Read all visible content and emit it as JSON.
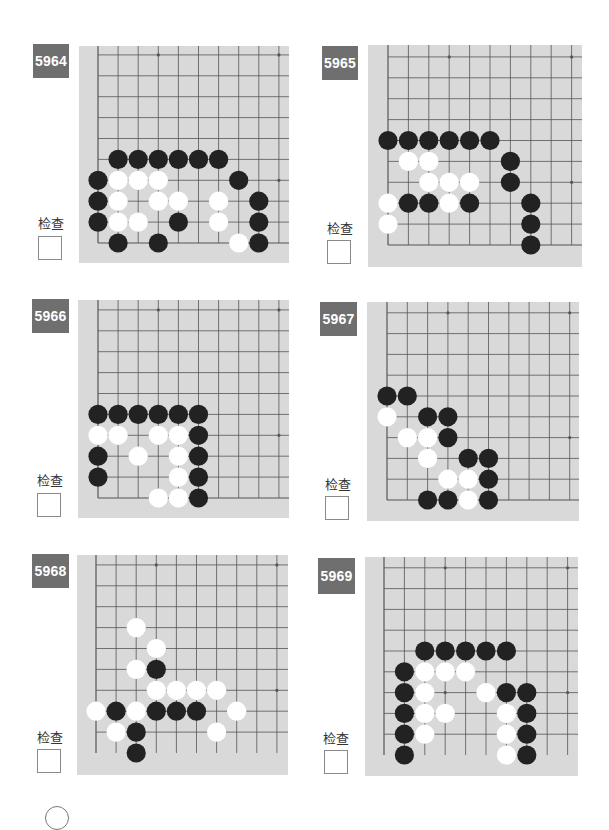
{
  "page": {
    "check_label": "检查",
    "colors": {
      "badge": "#6f6f6f",
      "board": "#d9d9d9",
      "grid": "#555555",
      "black_stone": "#222222",
      "white_stone": "#ffffff"
    }
  },
  "problems": [
    {
      "number": "5964",
      "badge": {
        "x": 33,
        "y": 44,
        "w": 36,
        "h": 34
      },
      "check": {
        "label_x": 33,
        "label_y": 213,
        "box_x": 38,
        "box_y": 236
      },
      "board": {
        "x": 79,
        "y": 46,
        "w": 210,
        "h": 217,
        "x0": 98,
        "y0": 243,
        "dx": 20.1,
        "dy": 20.9,
        "bottom_edge": true
      },
      "stones": [
        {
          "c": 1,
          "r": 4,
          "color": "B"
        },
        {
          "c": 2,
          "r": 4,
          "color": "B"
        },
        {
          "c": 3,
          "r": 4,
          "color": "B"
        },
        {
          "c": 4,
          "r": 4,
          "color": "B"
        },
        {
          "c": 5,
          "r": 4,
          "color": "B"
        },
        {
          "c": 6,
          "r": 4,
          "color": "B"
        },
        {
          "c": 0,
          "r": 3,
          "color": "B"
        },
        {
          "c": 1,
          "r": 3,
          "color": "W"
        },
        {
          "c": 2,
          "r": 3,
          "color": "W"
        },
        {
          "c": 3,
          "r": 3,
          "color": "W"
        },
        {
          "c": 7,
          "r": 3,
          "color": "B"
        },
        {
          "c": 0,
          "r": 2,
          "color": "B"
        },
        {
          "c": 1,
          "r": 2,
          "color": "W"
        },
        {
          "c": 3,
          "r": 2,
          "color": "W"
        },
        {
          "c": 4,
          "r": 2,
          "color": "W"
        },
        {
          "c": 6,
          "r": 2,
          "color": "W"
        },
        {
          "c": 8,
          "r": 2,
          "color": "B"
        },
        {
          "c": 0,
          "r": 1,
          "color": "B"
        },
        {
          "c": 1,
          "r": 1,
          "color": "W"
        },
        {
          "c": 2,
          "r": 1,
          "color": "W"
        },
        {
          "c": 4,
          "r": 1,
          "color": "B"
        },
        {
          "c": 6,
          "r": 1,
          "color": "W"
        },
        {
          "c": 8,
          "r": 1,
          "color": "B"
        },
        {
          "c": 1,
          "r": 0,
          "color": "B"
        },
        {
          "c": 3,
          "r": 0,
          "color": "B"
        },
        {
          "c": 7,
          "r": 0,
          "color": "W"
        },
        {
          "c": 8,
          "r": 0,
          "color": "B"
        }
      ]
    },
    {
      "number": "5965",
      "badge": {
        "x": 322,
        "y": 46,
        "w": 36,
        "h": 34
      },
      "check": {
        "label_x": 322,
        "label_y": 218,
        "box_x": 327,
        "box_y": 240
      },
      "board": {
        "x": 368,
        "y": 45,
        "w": 214,
        "h": 222,
        "x0": 388,
        "y0": 245,
        "dx": 20.4,
        "dy": 20.9,
        "bottom_edge": true
      },
      "stones": [
        {
          "c": 0,
          "r": 5,
          "color": "B"
        },
        {
          "c": 1,
          "r": 5,
          "color": "B"
        },
        {
          "c": 2,
          "r": 5,
          "color": "B"
        },
        {
          "c": 3,
          "r": 5,
          "color": "B"
        },
        {
          "c": 4,
          "r": 5,
          "color": "B"
        },
        {
          "c": 5,
          "r": 5,
          "color": "B"
        },
        {
          "c": 1,
          "r": 4,
          "color": "W"
        },
        {
          "c": 2,
          "r": 4,
          "color": "W"
        },
        {
          "c": 6,
          "r": 4,
          "color": "B"
        },
        {
          "c": 2,
          "r": 3,
          "color": "W"
        },
        {
          "c": 3,
          "r": 3,
          "color": "W"
        },
        {
          "c": 4,
          "r": 3,
          "color": "W"
        },
        {
          "c": 6,
          "r": 3,
          "color": "B"
        },
        {
          "c": 0,
          "r": 2,
          "color": "W"
        },
        {
          "c": 1,
          "r": 2,
          "color": "B"
        },
        {
          "c": 2,
          "r": 2,
          "color": "B"
        },
        {
          "c": 3,
          "r": 2,
          "color": "W"
        },
        {
          "c": 4,
          "r": 2,
          "color": "B"
        },
        {
          "c": 7,
          "r": 2,
          "color": "B"
        },
        {
          "c": 0,
          "r": 1,
          "color": "W"
        },
        {
          "c": 7,
          "r": 1,
          "color": "B"
        },
        {
          "c": 7,
          "r": 0,
          "color": "B"
        }
      ]
    },
    {
      "number": "5966",
      "badge": {
        "x": 32,
        "y": 299,
        "w": 37,
        "h": 34
      },
      "check": {
        "label_x": 32,
        "label_y": 470,
        "box_x": 37,
        "box_y": 493
      },
      "board": {
        "x": 78,
        "y": 300,
        "w": 211,
        "h": 218,
        "x0": 98,
        "y0": 498,
        "dx": 20.1,
        "dy": 20.9,
        "bottom_edge": true
      },
      "stones": [
        {
          "c": 0,
          "r": 4,
          "color": "B"
        },
        {
          "c": 1,
          "r": 4,
          "color": "B"
        },
        {
          "c": 2,
          "r": 4,
          "color": "B"
        },
        {
          "c": 3,
          "r": 4,
          "color": "B"
        },
        {
          "c": 4,
          "r": 4,
          "color": "B"
        },
        {
          "c": 5,
          "r": 4,
          "color": "B"
        },
        {
          "c": 0,
          "r": 3,
          "color": "W"
        },
        {
          "c": 1,
          "r": 3,
          "color": "W"
        },
        {
          "c": 3,
          "r": 3,
          "color": "W"
        },
        {
          "c": 4,
          "r": 3,
          "color": "W"
        },
        {
          "c": 5,
          "r": 3,
          "color": "B"
        },
        {
          "c": 0,
          "r": 2,
          "color": "B"
        },
        {
          "c": 2,
          "r": 2,
          "color": "W"
        },
        {
          "c": 4,
          "r": 2,
          "color": "W"
        },
        {
          "c": 5,
          "r": 2,
          "color": "B"
        },
        {
          "c": 0,
          "r": 1,
          "color": "B"
        },
        {
          "c": 4,
          "r": 1,
          "color": "W"
        },
        {
          "c": 5,
          "r": 1,
          "color": "B"
        },
        {
          "c": 3,
          "r": 0,
          "color": "W"
        },
        {
          "c": 4,
          "r": 0,
          "color": "W"
        },
        {
          "c": 5,
          "r": 0,
          "color": "B"
        }
      ]
    },
    {
      "number": "5967",
      "badge": {
        "x": 320,
        "y": 302,
        "w": 37,
        "h": 34
      },
      "check": {
        "label_x": 320,
        "label_y": 474,
        "box_x": 325,
        "box_y": 496
      },
      "board": {
        "x": 367,
        "y": 302,
        "w": 212,
        "h": 219,
        "x0": 387,
        "y0": 500,
        "dx": 20.3,
        "dy": 20.8,
        "bottom_edge": true
      },
      "stones": [
        {
          "c": 0,
          "r": 5,
          "color": "B"
        },
        {
          "c": 1,
          "r": 5,
          "color": "B"
        },
        {
          "c": 0,
          "r": 4,
          "color": "W"
        },
        {
          "c": 2,
          "r": 4,
          "color": "B"
        },
        {
          "c": 3,
          "r": 4,
          "color": "B"
        },
        {
          "c": 1,
          "r": 3,
          "color": "W"
        },
        {
          "c": 2,
          "r": 3,
          "color": "W"
        },
        {
          "c": 3,
          "r": 3,
          "color": "B"
        },
        {
          "c": 2,
          "r": 2,
          "color": "W"
        },
        {
          "c": 4,
          "r": 2,
          "color": "B"
        },
        {
          "c": 5,
          "r": 2,
          "color": "B"
        },
        {
          "c": 3,
          "r": 1,
          "color": "W"
        },
        {
          "c": 4,
          "r": 1,
          "color": "W"
        },
        {
          "c": 5,
          "r": 1,
          "color": "B"
        },
        {
          "c": 2,
          "r": 0,
          "color": "B"
        },
        {
          "c": 3,
          "r": 0,
          "color": "B"
        },
        {
          "c": 4,
          "r": 0,
          "color": "W"
        },
        {
          "c": 5,
          "r": 0,
          "color": "B"
        }
      ]
    },
    {
      "number": "5968",
      "badge": {
        "x": 32,
        "y": 554,
        "w": 37,
        "h": 34
      },
      "check": {
        "label_x": 32,
        "label_y": 727,
        "box_x": 37,
        "box_y": 749
      },
      "board": {
        "x": 77,
        "y": 555,
        "w": 211,
        "h": 220,
        "x0": 96,
        "y0": 753,
        "dx": 20.1,
        "dy": 20.9,
        "bottom_edge": false
      },
      "stones": [
        {
          "c": 2,
          "r": 6,
          "color": "W"
        },
        {
          "c": 3,
          "r": 5,
          "color": "W"
        },
        {
          "c": 2,
          "r": 4,
          "color": "W"
        },
        {
          "c": 3,
          "r": 4,
          "color": "B"
        },
        {
          "c": 3,
          "r": 3,
          "color": "W"
        },
        {
          "c": 4,
          "r": 3,
          "color": "W"
        },
        {
          "c": 5,
          "r": 3,
          "color": "W"
        },
        {
          "c": 6,
          "r": 3,
          "color": "W"
        },
        {
          "c": 0,
          "r": 2,
          "color": "W"
        },
        {
          "c": 1,
          "r": 2,
          "color": "B"
        },
        {
          "c": 2,
          "r": 2,
          "color": "W"
        },
        {
          "c": 3,
          "r": 2,
          "color": "B"
        },
        {
          "c": 4,
          "r": 2,
          "color": "B"
        },
        {
          "c": 5,
          "r": 2,
          "color": "B"
        },
        {
          "c": 7,
          "r": 2,
          "color": "W"
        },
        {
          "c": 1,
          "r": 1,
          "color": "W"
        },
        {
          "c": 2,
          "r": 1,
          "color": "B"
        },
        {
          "c": 6,
          "r": 1,
          "color": "W"
        },
        {
          "c": 2,
          "r": 0,
          "color": "B"
        }
      ]
    },
    {
      "number": "5969",
      "badge": {
        "x": 318,
        "y": 558,
        "w": 37,
        "h": 36
      },
      "check": {
        "label_x": 318,
        "label_y": 728,
        "box_x": 324,
        "box_y": 750
      },
      "board": {
        "x": 365,
        "y": 557,
        "w": 213,
        "h": 219,
        "x0": 384,
        "y0": 755,
        "dx": 20.4,
        "dy": 20.8,
        "bottom_edge": false
      },
      "stones": [
        {
          "c": 2,
          "r": 5,
          "color": "B"
        },
        {
          "c": 3,
          "r": 5,
          "color": "B"
        },
        {
          "c": 4,
          "r": 5,
          "color": "B"
        },
        {
          "c": 5,
          "r": 5,
          "color": "B"
        },
        {
          "c": 6,
          "r": 5,
          "color": "B"
        },
        {
          "c": 1,
          "r": 4,
          "color": "B"
        },
        {
          "c": 2,
          "r": 4,
          "color": "W"
        },
        {
          "c": 3,
          "r": 4,
          "color": "W"
        },
        {
          "c": 4,
          "r": 4,
          "color": "W"
        },
        {
          "c": 1,
          "r": 3,
          "color": "B"
        },
        {
          "c": 2,
          "r": 3,
          "color": "W"
        },
        {
          "c": 5,
          "r": 3,
          "color": "W"
        },
        {
          "c": 6,
          "r": 3,
          "color": "B"
        },
        {
          "c": 7,
          "r": 3,
          "color": "B"
        },
        {
          "c": 1,
          "r": 2,
          "color": "B"
        },
        {
          "c": 2,
          "r": 2,
          "color": "W"
        },
        {
          "c": 3,
          "r": 2,
          "color": "W"
        },
        {
          "c": 6,
          "r": 2,
          "color": "W"
        },
        {
          "c": 7,
          "r": 2,
          "color": "B"
        },
        {
          "c": 1,
          "r": 1,
          "color": "B"
        },
        {
          "c": 2,
          "r": 1,
          "color": "W"
        },
        {
          "c": 6,
          "r": 1,
          "color": "W"
        },
        {
          "c": 7,
          "r": 1,
          "color": "B"
        },
        {
          "c": 1,
          "r": 0,
          "color": "B"
        },
        {
          "c": 6,
          "r": 0,
          "color": "W"
        },
        {
          "c": 7,
          "r": 0,
          "color": "B"
        }
      ]
    }
  ],
  "board_spec": {
    "columns": 10,
    "rows": 10,
    "star_points": [
      [
        3,
        3
      ],
      [
        9,
        3
      ],
      [
        3,
        9
      ],
      [
        9,
        9
      ]
    ]
  }
}
